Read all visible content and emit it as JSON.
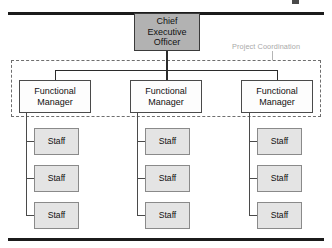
{
  "diagram": {
    "type": "org-chart",
    "coordination": {
      "label": "Project Coordination",
      "style": "dashed-boundary"
    },
    "colors": {
      "ceo_fill": "#b2b2b2",
      "manager_fill": "#fdfdfd",
      "staff_fill": "#e4e4e4",
      "line": "#2b2b2b",
      "dashed_boundary": "#6e6e6e",
      "coord_label": "#a9a9a9",
      "rule": "#1b1b1b"
    },
    "ceo": {
      "line1": "Chief",
      "line2": "Executive",
      "line3": "Officer"
    },
    "managers": [
      {
        "line1": "Functional",
        "line2": "Manager",
        "staff": [
          {
            "label": "Staff"
          },
          {
            "label": "Staff"
          },
          {
            "label": "Staff"
          }
        ]
      },
      {
        "line1": "Functional",
        "line2": "Manager",
        "staff": [
          {
            "label": "Staff"
          },
          {
            "label": "Staff"
          },
          {
            "label": "Staff"
          }
        ]
      },
      {
        "line1": "Functional",
        "line2": "Manager",
        "staff": [
          {
            "label": "Staff"
          },
          {
            "label": "Staff"
          },
          {
            "label": "Staff"
          }
        ]
      }
    ]
  }
}
